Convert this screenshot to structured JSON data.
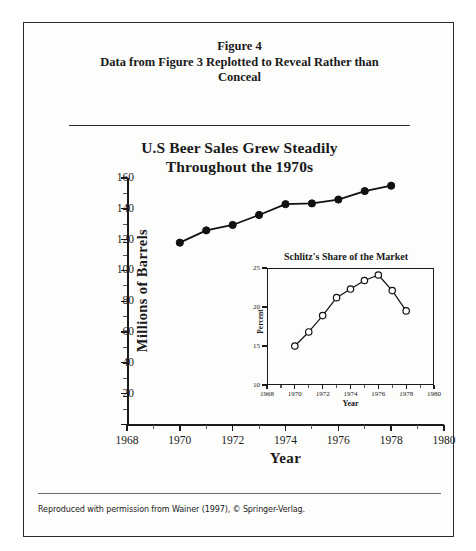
{
  "page": {
    "caption_line1": "Figure 4",
    "caption_line2": "Data from Figure 3 Replotted to Reveal Rather than",
    "caption_line3": "Conceal",
    "credit": "Reproduced with permission from Wainer (1997), © Springer-Verlag."
  },
  "chart_data": [
    {
      "type": "line",
      "id": "main",
      "title": "U.S Beer Sales Grew Steadily Throughout the 1970s",
      "title_line1": "U.S Beer Sales Grew Steadily",
      "title_line2": "Throughout the 1970s",
      "xlabel": "Year",
      "ylabel": "Millions  of  Barrels",
      "xlim": [
        1968,
        1980
      ],
      "ylim": [
        0,
        160
      ],
      "xticks": [
        1968,
        1970,
        1972,
        1974,
        1976,
        1978,
        1980
      ],
      "yticks": [
        0,
        20,
        40,
        60,
        80,
        100,
        120,
        140,
        160
      ],
      "ytick_labels": [
        "0",
        "20",
        "40",
        "60",
        "80",
        "100",
        "120",
        "140",
        "160"
      ],
      "grid": false,
      "legend": "none",
      "marker": "filled-circle",
      "x": [
        1970,
        1971,
        1972,
        1973,
        1974,
        1975,
        1976,
        1977,
        1978
      ],
      "values": [
        118,
        126,
        129.5,
        136,
        143,
        143.5,
        146,
        151.5,
        155
      ]
    },
    {
      "type": "line",
      "id": "inset",
      "title": "Schlitz's Share of the Market",
      "xlabel": "Year",
      "ylabel": "Percent",
      "xlim": [
        1968,
        1980
      ],
      "ylim": [
        10,
        25
      ],
      "xticks": [
        1968,
        1970,
        1972,
        1974,
        1976,
        1978,
        1980
      ],
      "yticks": [
        10,
        15,
        20,
        25
      ],
      "ytick_labels": [
        "10",
        "15",
        "20",
        "25"
      ],
      "grid": false,
      "legend": "none",
      "marker": "open-circle",
      "x": [
        1970,
        1971,
        1972,
        1973,
        1974,
        1975,
        1976,
        1977,
        1978
      ],
      "values": [
        15.0,
        16.8,
        18.9,
        21.2,
        22.3,
        23.4,
        24.1,
        22.1,
        19.5
      ]
    }
  ]
}
